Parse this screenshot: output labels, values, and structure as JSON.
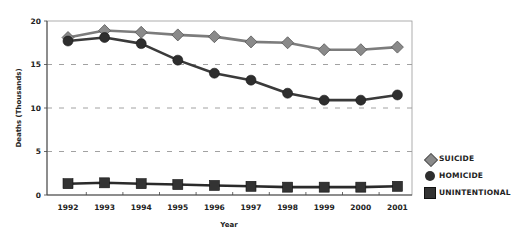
{
  "chart_data": {
    "type": "line",
    "title": "",
    "xlabel": "Year",
    "ylabel": "Deaths (Thousands)",
    "ylim": [
      0,
      20
    ],
    "yticks": [
      0,
      5,
      10,
      15,
      20
    ],
    "grid": "horizontal dashed",
    "legend_position": "right",
    "categories": [
      "1992",
      "1993",
      "1994",
      "1995",
      "1996",
      "1997",
      "1998",
      "1999",
      "2000",
      "2001"
    ],
    "series": [
      {
        "name": "SUICIDE",
        "marker": "diamond",
        "color": "#8a8a8a",
        "values": [
          18.1,
          18.9,
          18.7,
          18.4,
          18.2,
          17.6,
          17.5,
          16.7,
          16.7,
          17.0
        ]
      },
      {
        "name": "HOMICIDE",
        "marker": "circle",
        "color": "#2e2e2e",
        "values": [
          17.7,
          18.1,
          17.4,
          15.5,
          14.0,
          13.2,
          11.7,
          10.9,
          10.9,
          11.5
        ]
      },
      {
        "name": "UNINTENTIONAL",
        "marker": "square",
        "color": "#333333",
        "values": [
          1.3,
          1.4,
          1.3,
          1.2,
          1.1,
          1.0,
          0.9,
          0.9,
          0.9,
          1.0
        ]
      }
    ]
  },
  "legend": {
    "items": [
      {
        "label": "SUICIDE"
      },
      {
        "label": "HOMICIDE"
      },
      {
        "label": "UNINTENTIONAL"
      }
    ]
  }
}
